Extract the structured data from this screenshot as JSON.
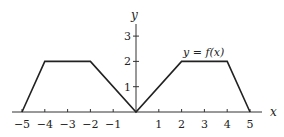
{
  "chart_data": {
    "type": "line",
    "title": "",
    "xlabel": "x",
    "ylabel": "y",
    "annotation": "y = f(x)",
    "x": [
      -5,
      -4,
      -2,
      0,
      2,
      4,
      5
    ],
    "y": [
      0,
      2,
      2,
      0,
      2,
      2,
      0
    ],
    "series": [
      {
        "name": "y = f(x)",
        "x": [
          -5,
          -4,
          -2,
          0,
          2,
          4,
          5
        ],
        "values": [
          0,
          2,
          2,
          0,
          2,
          2,
          0
        ]
      }
    ],
    "xticks": [
      "-5",
      "-4",
      "-3",
      "-2",
      "-1",
      "1",
      "2",
      "3",
      "4",
      "5"
    ],
    "yticks": [
      "1",
      "2",
      "3"
    ],
    "xlim": [
      -5.5,
      5.5
    ],
    "ylim": [
      0,
      3.5
    ],
    "grid": false,
    "legend": "none"
  }
}
